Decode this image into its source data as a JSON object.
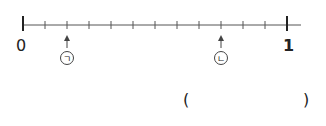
{
  "number_line": {
    "start_label": "0",
    "end_label": "1",
    "intervals": 12,
    "markers": [
      {
        "label": "㉠",
        "glyph": "ㄱ",
        "position_index": 2
      },
      {
        "label": "㉡",
        "glyph": "ㄴ",
        "position_index": 9
      }
    ]
  },
  "answer_box": {
    "open_paren": "(",
    "close_paren": ")",
    "value": ""
  }
}
